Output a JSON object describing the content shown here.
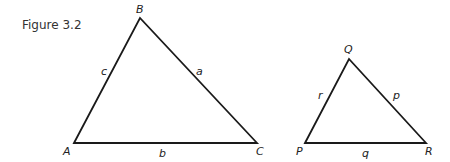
{
  "caption": "Figure 3.2",
  "triangles": [
    {
      "name": "ABC",
      "vertices": {
        "A": [
          74,
          143
        ],
        "B": [
          140,
          18
        ],
        "C": [
          257,
          143
        ]
      },
      "vertex_labels": {
        "A": "A",
        "B": "B",
        "C": "C"
      },
      "side_labels": {
        "a": "a",
        "b": "b",
        "c": "c"
      }
    },
    {
      "name": "PQR",
      "vertices": {
        "P": [
          305,
          143
        ],
        "Q": [
          349,
          59
        ],
        "R": [
          426,
          143
        ]
      },
      "vertex_labels": {
        "P": "P",
        "Q": "Q",
        "R": "R"
      },
      "side_labels": {
        "p": "p",
        "q": "q",
        "r": "r"
      }
    }
  ],
  "stroke_color": "#1a1a1a"
}
